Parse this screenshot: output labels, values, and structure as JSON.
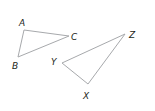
{
  "diagram": {
    "stroke_color": "#a7a9ac",
    "label_color": "#231f20",
    "triangles": [
      {
        "name": "ABC",
        "vertices": {
          "A": {
            "x": 24,
            "y": 30
          },
          "B": {
            "x": 18,
            "y": 57
          },
          "C": {
            "x": 69,
            "y": 36
          }
        },
        "labels": {
          "A": "A",
          "B": "B",
          "C": "C"
        }
      },
      {
        "name": "XYZ",
        "vertices": {
          "X": {
            "x": 88,
            "y": 84
          },
          "Y": {
            "x": 62,
            "y": 63
          },
          "Z": {
            "x": 125,
            "y": 34
          }
        },
        "labels": {
          "X": "X",
          "Y": "Y",
          "Z": "Z"
        }
      }
    ]
  }
}
